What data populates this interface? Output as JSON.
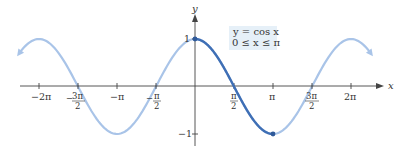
{
  "chart_data": {
    "type": "line",
    "title": "",
    "xlabel": "x",
    "ylabel": "y",
    "xlim": [
      -2.3562,
      2.3562
    ],
    "ylim": [
      -1,
      1
    ],
    "x_ticks": [
      "−2π",
      "−3π/2",
      "−π",
      "−π/2",
      "π/2",
      "π",
      "3π/2",
      "2π"
    ],
    "x_tick_values": [
      -6.2832,
      -4.7124,
      -3.1416,
      -1.5708,
      1.5708,
      3.1416,
      4.7124,
      6.2832
    ],
    "y_ticks": [
      "1",
      "−1"
    ],
    "y_tick_values": [
      1,
      -1
    ],
    "grid": false,
    "annotation": {
      "line1": "y = cos x",
      "line2": "0 ≤ x ≤ π"
    },
    "series": [
      {
        "name": "y = cos x (full)",
        "function": "cos(x)",
        "x_range": [
          -7.07,
          7.07
        ],
        "color": "#a9c4e8",
        "style": "light, arrows at both ends"
      },
      {
        "name": "y = cos x, 0 ≤ x ≤ π",
        "function": "cos(x)",
        "x_range": [
          0,
          3.1416
        ],
        "color": "#3f6fb5",
        "style": "dark, endpoint dots at (0,1) and (π,−1)"
      }
    ],
    "points": [
      {
        "x": 0,
        "y": 1
      },
      {
        "x": 1.5708,
        "y": 0
      },
      {
        "x": 3.1416,
        "y": -1
      }
    ]
  },
  "labels": {
    "x_axis": "x",
    "y_axis": "y",
    "y_tick_1": "1",
    "y_tick_neg1": "−1",
    "ticks": {
      "neg2pi": "−2π",
      "neg3pi2_num": "3π",
      "neg3pi2_sign": "−",
      "neg3pi2_den": "2",
      "negpi": "−π",
      "negpi2_num": "π",
      "negpi2_sign": "−",
      "negpi2_den": "2",
      "pi2_num": "π",
      "pi2_den": "2",
      "pi": "π",
      "threepi2_num": "3π",
      "threepi2_den": "2",
      "twopi": "2π"
    },
    "box_line1": "y = cos x",
    "box_line2": "0 ≤ x ≤ π"
  },
  "colors": {
    "light_curve": "#a9c4e8",
    "dark_curve": "#3f6fb5",
    "axis": "#444444",
    "box_bg": "#e6f0f8"
  }
}
